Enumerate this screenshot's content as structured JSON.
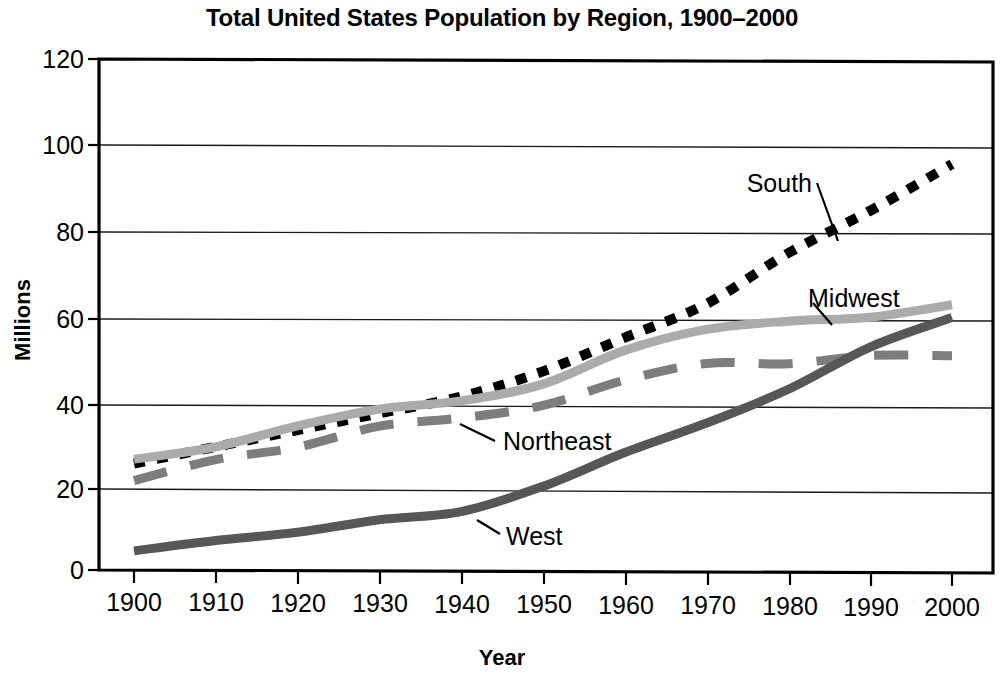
{
  "chart_data": {
    "type": "line",
    "title": "Total United States Population by Region, 1900–2000",
    "xlabel": "Year",
    "ylabel": "Millions",
    "x": [
      1900,
      1910,
      1920,
      1930,
      1940,
      1950,
      1960,
      1970,
      1980,
      1990,
      2000
    ],
    "xlim": [
      1900,
      2000
    ],
    "ylim": [
      0,
      120
    ],
    "ytick_values": [
      0,
      20,
      40,
      60,
      80,
      100,
      120
    ],
    "ytick_labels": [
      "0",
      "20",
      "40",
      "60",
      "80",
      "100",
      "120"
    ],
    "xtick_labels": [
      "1900",
      "1910",
      "1920",
      "1930",
      "1940",
      "1950",
      "1960",
      "1970",
      "1980",
      "1990",
      "2000"
    ],
    "grid": "horizontal",
    "legend_position": "inline-annotations",
    "series": [
      {
        "name": "South",
        "label": "South",
        "style": "dotted",
        "color": "#000000",
        "values": [
          25,
          29,
          33,
          37,
          41,
          47,
          55,
          63,
          75,
          85,
          96
        ]
      },
      {
        "name": "Midwest",
        "label": "Midwest",
        "style": "solid",
        "color": "#ababab",
        "values": [
          26,
          29,
          34,
          38,
          40,
          44,
          52,
          57,
          59,
          60,
          63
        ]
      },
      {
        "name": "Northeast",
        "label": "Northeast",
        "style": "dashed",
        "color": "#7d7d7d",
        "values": [
          21,
          26,
          29,
          34,
          36,
          39,
          45,
          49,
          49,
          51,
          51
        ]
      },
      {
        "name": "West",
        "label": "West",
        "style": "solid",
        "color": "#575757",
        "values": [
          4.5,
          7,
          9,
          12,
          14,
          20,
          28,
          35,
          43,
          53,
          60
        ]
      }
    ],
    "annotations": [
      {
        "text": "South",
        "points_to_series": "South",
        "at_year": 1986
      },
      {
        "text": "Midwest",
        "points_to_series": "Midwest",
        "at_year": 1986
      },
      {
        "text": "Northeast",
        "points_to_series": "Northeast",
        "at_year": 1938
      },
      {
        "text": "West",
        "points_to_series": "West",
        "at_year": 1943
      }
    ]
  }
}
